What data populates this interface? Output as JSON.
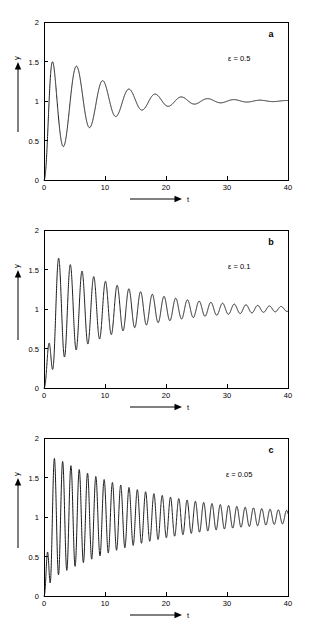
{
  "figure": {
    "panels": [
      {
        "letter": "a",
        "param_label": "ε = 0.5",
        "epsilon": 0.5,
        "y_axis_name": "y",
        "x_axis_name": "t"
      },
      {
        "letter": "b",
        "param_label": "ε = 0.1",
        "epsilon": 0.1,
        "y_axis_name": "y",
        "x_axis_name": "t"
      },
      {
        "letter": "c",
        "param_label": "ε = 0.05",
        "epsilon": 0.05,
        "y_axis_name": "y",
        "x_axis_name": "t"
      }
    ]
  },
  "chart_data": [
    {
      "type": "line",
      "title": "",
      "subtitle": "",
      "xlabel": "t",
      "ylabel": "y",
      "xlim": [
        0,
        40
      ],
      "ylim": [
        0,
        2
      ],
      "xticks": [
        0,
        10,
        20,
        30,
        40
      ],
      "xticklabels": [
        "0",
        "10",
        "20",
        "30",
        "40"
      ],
      "yticks": [
        0,
        0.5,
        1,
        1.5,
        2
      ],
      "yticklabels": [
        "0",
        "0.5",
        "1",
        "1.5",
        "2"
      ],
      "grid": false,
      "legend": null,
      "annotations": [
        {
          "text": "a",
          "x_frac": 0.93,
          "y_frac": 0.93
        },
        {
          "text": "ε = 0.5",
          "x_frac": 0.8,
          "y_frac": 0.78
        }
      ],
      "series": [
        {
          "name": "y(t), epsilon = 0.5",
          "model": "damped_oscillation",
          "baseline": 1.0,
          "amplitude": 0.86,
          "decay_rate": 0.125,
          "period": 4.3,
          "rise_time": 0.9,
          "phase_deg": -90,
          "x": [
            0,
            0.9,
            2.6,
            4.8,
            6.7,
            8.9,
            11.0,
            13.2,
            15.3,
            17.4,
            19.6,
            21.7,
            23.9,
            26.0,
            28.2,
            30.3,
            32.5,
            34.6,
            36.8,
            38.9,
            40
          ],
          "y": [
            0.02,
            0.05,
            1.8,
            0.37,
            1.51,
            0.6,
            1.33,
            0.74,
            1.22,
            0.83,
            1.15,
            0.89,
            1.1,
            0.93,
            1.07,
            0.95,
            1.05,
            0.97,
            1.03,
            0.98,
            1.0
          ]
        }
      ]
    },
    {
      "type": "line",
      "title": "",
      "subtitle": "",
      "xlabel": "t",
      "ylabel": "y",
      "xlim": [
        0,
        40
      ],
      "ylim": [
        0,
        2
      ],
      "xticks": [
        0,
        10,
        20,
        30,
        40
      ],
      "xticklabels": [
        "0",
        "10",
        "20",
        "30",
        "40"
      ],
      "yticks": [
        0,
        0.5,
        1,
        1.5,
        2
      ],
      "yticklabels": [
        "0",
        "0.5",
        "1",
        "1.5",
        "2"
      ],
      "grid": false,
      "legend": null,
      "annotations": [
        {
          "text": "b",
          "x_frac": 0.93,
          "y_frac": 0.93
        },
        {
          "text": "ε = 0.1",
          "x_frac": 0.8,
          "y_frac": 0.78
        }
      ],
      "series": [
        {
          "name": "y(t), epsilon = 0.1",
          "model": "damped_oscillation",
          "baseline": 1.0,
          "amplitude": 0.8,
          "decay_rate": 0.082,
          "period": 1.92,
          "rise_time": 1.1,
          "phase_deg": -90,
          "x": [
            0,
            1.2,
            2.9,
            3.9,
            4.8,
            5.8,
            6.7,
            7.7,
            8.7,
            9.6,
            10.6,
            12.5,
            14.4,
            16.4,
            18.3,
            20.2,
            22.1,
            24.1,
            26.0,
            28.0,
            30.0,
            32.0,
            34.0,
            36.0,
            38.0,
            40
          ],
          "y": [
            0.02,
            0.3,
            1.72,
            0.35,
            1.6,
            0.42,
            1.53,
            0.5,
            1.45,
            0.58,
            1.38,
            1.32,
            1.26,
            1.21,
            1.17,
            1.13,
            1.11,
            1.09,
            1.07,
            1.06,
            1.05,
            1.04,
            1.03,
            1.02,
            1.02,
            1.0
          ]
        }
      ]
    },
    {
      "type": "line",
      "title": "",
      "subtitle": "",
      "xlabel": "t",
      "ylabel": "y",
      "xlim": [
        0,
        40
      ],
      "ylim": [
        0,
        2
      ],
      "xticks": [
        0,
        10,
        20,
        30,
        40
      ],
      "xticklabels": [
        "0",
        "10",
        "20",
        "30",
        "40"
      ],
      "yticks": [
        0,
        0.5,
        1,
        1.5,
        2
      ],
      "yticklabels": [
        "0",
        "0.5",
        "1",
        "1.5",
        "2"
      ],
      "grid": false,
      "legend": null,
      "annotations": [
        {
          "text": "c",
          "x_frac": 0.93,
          "y_frac": 0.93
        },
        {
          "text": "ε = 0.05",
          "x_frac": 0.8,
          "y_frac": 0.78
        }
      ],
      "series": [
        {
          "name": "y(t), epsilon = 0.05",
          "model": "damped_oscillation",
          "baseline": 1.0,
          "amplitude": 0.84,
          "decay_rate": 0.058,
          "period": 1.36,
          "rise_time": 0.8,
          "phase_deg": -90,
          "x": [
            0,
            0.9,
            2.2,
            2.9,
            3.6,
            4.3,
            5.0,
            5.7,
            6.4,
            7.1,
            7.8,
            8.5,
            9.9,
            11.3,
            12.6,
            14.0,
            15.4,
            16.8,
            18.1,
            20.0,
            22.0,
            24.0,
            26.0,
            28.0,
            30.0,
            33.0,
            36.0,
            38.0,
            40
          ],
          "y": [
            0.02,
            0.16,
            1.8,
            0.24,
            1.74,
            0.31,
            1.68,
            0.37,
            1.62,
            0.42,
            1.57,
            0.47,
            1.48,
            1.41,
            1.36,
            1.31,
            1.27,
            1.23,
            1.2,
            1.16,
            1.13,
            1.11,
            1.09,
            1.07,
            1.06,
            1.05,
            1.04,
            1.03,
            1.0
          ]
        }
      ]
    }
  ]
}
